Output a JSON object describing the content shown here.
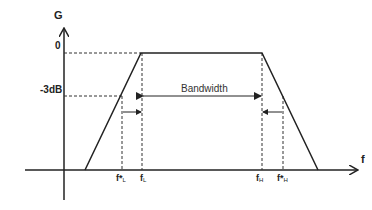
{
  "diagram": {
    "type": "bandpass-frequency-response",
    "axes": {
      "y_label": "G",
      "x_label": "f"
    },
    "levels": {
      "top": "0",
      "cutoff": "-3dB"
    },
    "annotation": {
      "bandwidth": "Bandwidth"
    },
    "frequencies": [
      {
        "id": "f_star_L",
        "main": "f*",
        "sub": "L"
      },
      {
        "id": "f_L",
        "main": "f",
        "sub": "L"
      },
      {
        "id": "f_H",
        "main": "f",
        "sub": "H"
      },
      {
        "id": "f_star_H",
        "main": "f*",
        "sub": "H"
      }
    ],
    "colors": {
      "line": "#222222",
      "dashed": "#333333"
    }
  }
}
